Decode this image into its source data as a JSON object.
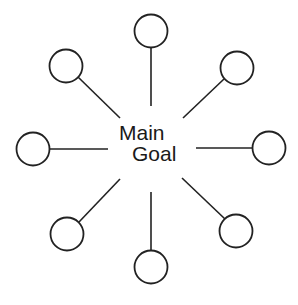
{
  "diagram": {
    "type": "mind-map",
    "center": {
      "line1": "Main",
      "line2": "Goal"
    },
    "colors": {
      "stroke": "#222222",
      "background": "#ffffff",
      "text": "#1a1a1a"
    },
    "nodes": [
      {
        "id": "top",
        "label": ""
      },
      {
        "id": "top-right",
        "label": ""
      },
      {
        "id": "right",
        "label": ""
      },
      {
        "id": "bottom-right",
        "label": ""
      },
      {
        "id": "bottom",
        "label": ""
      },
      {
        "id": "bottom-left",
        "label": ""
      },
      {
        "id": "left",
        "label": ""
      },
      {
        "id": "top-left",
        "label": ""
      }
    ]
  }
}
